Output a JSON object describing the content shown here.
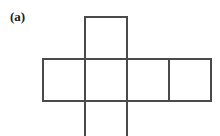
{
  "figure": {
    "panel_label": "(a)",
    "caption": "",
    "type": "cube-net-diagram",
    "stroke_color": "#4a4a4a",
    "fill_color": "#ffffff",
    "background_color": "#ffffff",
    "stroke_width": 1.6,
    "cell_size": 42,
    "geometry": {
      "strip_left": 42,
      "strip_top": 58,
      "strip_right": 210,
      "strip_bottom": 100,
      "column_x": [
        42,
        84,
        126,
        168,
        210
      ],
      "top_square": {
        "x": 84,
        "y": 16,
        "w": 42,
        "h": 42
      },
      "bottom_square": {
        "x": 84,
        "y": 100,
        "w": 42,
        "h": 36,
        "clipped": true
      },
      "strip_squares": [
        {
          "index": 1,
          "x": 42,
          "y": 58,
          "w": 42,
          "h": 42
        },
        {
          "index": 2,
          "x": 84,
          "y": 58,
          "w": 42,
          "h": 42
        },
        {
          "index": 3,
          "x": 126,
          "y": 58,
          "w": 42,
          "h": 42
        },
        {
          "index": 4,
          "x": 168,
          "y": 58,
          "w": 42,
          "h": 42
        }
      ]
    },
    "square_count_visible": 6
  }
}
